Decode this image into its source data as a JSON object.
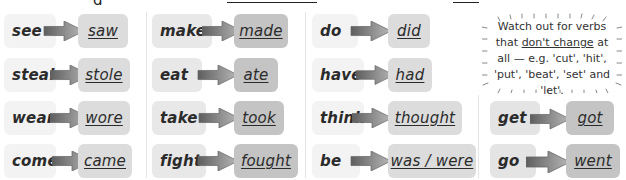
{
  "header": {
    "cropped_text_fragments": [
      "g",
      "...y g ... ... ... ..."
    ]
  },
  "columns": [
    {
      "pairs": [
        {
          "base": "see",
          "past": "saw"
        },
        {
          "base": "steal",
          "past": "stole"
        },
        {
          "base": "wear",
          "past": "wore"
        },
        {
          "base": "come",
          "past": "came"
        }
      ]
    },
    {
      "pairs": [
        {
          "base": "make",
          "past": "made"
        },
        {
          "base": "eat",
          "past": "ate"
        },
        {
          "base": "take",
          "past": "took"
        },
        {
          "base": "fight",
          "past": "fought"
        }
      ]
    },
    {
      "pairs": [
        {
          "base": "do",
          "past": "did"
        },
        {
          "base": "have",
          "past": "had"
        },
        {
          "base": "think",
          "past": "thought"
        },
        {
          "base": "be",
          "past": "was / were"
        }
      ]
    },
    {
      "pairs": [
        {
          "base": "get",
          "past": "got"
        },
        {
          "base": "go",
          "past": "went"
        }
      ]
    }
  ],
  "note": {
    "line1": "Watch out for verbs",
    "line2_pre": "that ",
    "line2_em": "don't change",
    "line2_post": " at",
    "line3": "all — e.g. 'cut', 'hit',",
    "line4": "'put', 'beat', 'set' and 'let'."
  },
  "colors": {
    "base_box": "#f3f3f3",
    "past_box_light": "#dcdcdc",
    "past_box_dark": "#c4c4c4",
    "arrow": "#7a7a7a",
    "text": "#2b2b2b"
  }
}
